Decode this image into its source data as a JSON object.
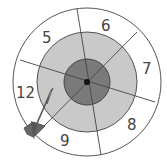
{
  "diagram": {
    "type": "dartboard",
    "colors": {
      "background": "#ffffff",
      "outer_ring": "#ffffff",
      "middle_ring": "#c9c9c9",
      "inner_ring": "#7a7a7a",
      "bullseye": "#111111",
      "lines": "#444444",
      "dart": "#555555"
    },
    "segment_labels": [
      {
        "label": "5",
        "x": 47,
        "y": 42
      },
      {
        "label": "6",
        "x": 101,
        "y": 30
      },
      {
        "label": "7",
        "x": 143,
        "y": 74
      },
      {
        "label": "8",
        "x": 128,
        "y": 130
      },
      {
        "label": "9",
        "x": 63,
        "y": 146
      },
      {
        "label": "12",
        "x": 18,
        "y": 98
      }
    ]
  }
}
